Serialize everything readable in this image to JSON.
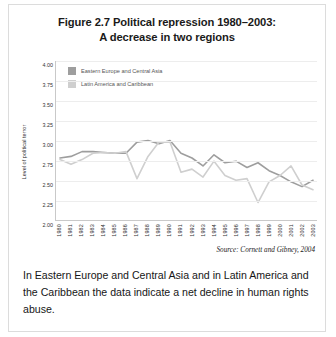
{
  "figure": {
    "title_line1": "Figure 2.7 Political repression 1980–2003:",
    "title_line2": "A decrease in two regions",
    "source": "Source: Cornett and Gibney, 2004",
    "caption": "In Eastern Europe and Central Asia and in Latin America and the Caribbean the data indicate a net decline in human rights abuse."
  },
  "colors": {
    "series1": "#9e9e9e",
    "series2": "#cfcfcf",
    "grid": "#ededed",
    "axis": "#c9c9c9",
    "text": "#1a1a1a"
  },
  "chart_data": {
    "type": "line",
    "title": "Figure 2.7 Political repression 1980–2003: A decrease in two regions",
    "xlabel": "",
    "ylabel": "Level of political terror",
    "ylim": [
      2.0,
      4.0
    ],
    "ytick_labels": [
      "4.00",
      "3.75",
      "3.50",
      "3.25",
      "3.00",
      "2.75",
      "2.50",
      "2.25",
      "2.00"
    ],
    "yticks": [
      4.0,
      3.75,
      3.5,
      3.25,
      3.0,
      2.75,
      2.5,
      2.25,
      2.0
    ],
    "grid": true,
    "legend_position": "top-left",
    "categories": [
      "1980",
      "1981",
      "1982",
      "1983",
      "1984",
      "1985",
      "1986",
      "1987",
      "1988",
      "1989",
      "1990",
      "1991",
      "1992",
      "1993",
      "1994",
      "1995",
      "1996",
      "1997",
      "1998",
      "1999",
      "2000",
      "2001",
      "2002",
      "2003"
    ],
    "series": [
      {
        "name": "Eastern Europe and Central Asia",
        "color": "#9e9e9e",
        "values": [
          2.78,
          2.8,
          2.86,
          2.86,
          2.85,
          2.84,
          2.84,
          2.98,
          3.0,
          2.96,
          3.0,
          2.84,
          2.78,
          2.68,
          2.82,
          2.72,
          2.74,
          2.66,
          2.72,
          2.62,
          2.56,
          2.48,
          2.42,
          2.5
        ]
      },
      {
        "name": "Latin America and Caribbean",
        "color": "#cfcfcf",
        "values": [
          2.76,
          2.7,
          2.76,
          2.84,
          2.85,
          2.84,
          2.86,
          2.52,
          2.8,
          2.98,
          2.98,
          2.6,
          2.64,
          2.54,
          2.74,
          2.56,
          2.5,
          2.52,
          2.22,
          2.48,
          2.56,
          2.68,
          2.44,
          2.38
        ]
      }
    ],
    "annotations": [
      "Source: Cornett and Gibney, 2004"
    ]
  }
}
